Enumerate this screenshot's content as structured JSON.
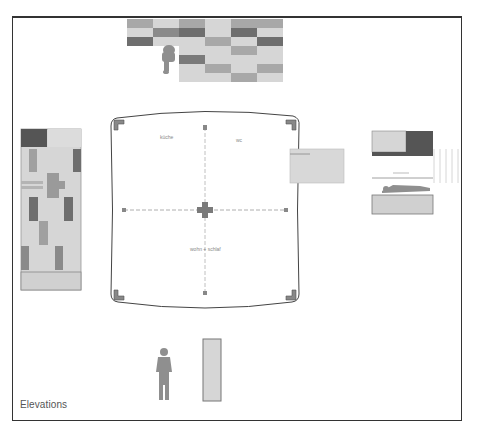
{
  "caption": "Elevations",
  "rooms": {
    "kitchen": "küche",
    "wc": "wc",
    "living": "wohn + schlaf"
  },
  "colors": {
    "frame": "#333333",
    "light": "#d6d6d6",
    "mid": "#a8a8a8",
    "dark": "#6e6e6e",
    "figure": "#8f8f8f",
    "outline": "#555555",
    "guide": "#9a9a9a"
  },
  "top_elevation": {
    "rows": [
      [
        "mid",
        "light",
        "mid",
        "light",
        "mid",
        "mid"
      ],
      [
        "light",
        "mid",
        "dark",
        "light",
        "dark",
        "light"
      ],
      [
        "dark",
        "light",
        "light",
        "mid",
        "light",
        "dark"
      ],
      [
        "none",
        "none",
        "light",
        "light",
        "mid",
        "light"
      ],
      [
        "none",
        "none",
        "dark",
        "light",
        "light",
        "light"
      ],
      [
        "none",
        "none",
        "light",
        "mid",
        "light",
        "mid"
      ],
      [
        "none",
        "none",
        "light",
        "light",
        "mid",
        "light"
      ]
    ]
  },
  "left_elevation": {
    "header": [
      "dark",
      "light"
    ]
  }
}
